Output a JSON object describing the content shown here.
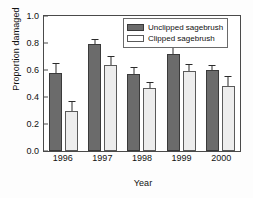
{
  "chart_data": {
    "type": "bar",
    "title": "",
    "xlabel": "Year",
    "ylabel": "Proportion damaged",
    "categories": [
      "1996",
      "1997",
      "1998",
      "1999",
      "2000"
    ],
    "ylim": [
      0.0,
      1.0
    ],
    "yticks": [
      "0.0",
      "0.2",
      "0.4",
      "0.6",
      "0.8",
      "1.0"
    ],
    "ytick_values": [
      0.0,
      0.2,
      0.4,
      0.6,
      0.8,
      1.0
    ],
    "grid": false,
    "legend_position": "top-right",
    "series": [
      {
        "name": "Unclipped sagebrush",
        "color": "#6b6b6b",
        "values": [
          0.58,
          0.79,
          0.57,
          0.72,
          0.6
        ],
        "errors_upper": [
          0.065,
          0.03,
          0.045,
          0.04,
          0.03
        ]
      },
      {
        "name": "Clipped sagebrush",
        "color": "#ededed",
        "values": [
          0.3,
          0.64,
          0.47,
          0.59,
          0.48
        ],
        "errors_upper": [
          0.06,
          0.06,
          0.035,
          0.045,
          0.065
        ]
      }
    ]
  },
  "legend": {
    "entries": [
      {
        "label": "Unclipped sagebrush"
      },
      {
        "label": "Clipped sagebrush"
      }
    ]
  }
}
